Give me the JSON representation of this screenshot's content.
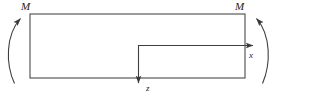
{
  "figure": {
    "title_visible": false,
    "background_color": "#ffffff",
    "line_color": "#444444",
    "text_color": "#1c1c1c",
    "width": 316,
    "height": 100
  },
  "labels": {
    "moment_left": "M",
    "moment_right": "M",
    "axis_x": "x",
    "axis_z": "z"
  },
  "geometry": {
    "beam_rect": {
      "x": 30,
      "y": 14,
      "width": 215,
      "height": 64
    },
    "axis_origin": {
      "x": 138,
      "y": 45
    },
    "x_axis_end": {
      "x": 255,
      "y": 45
    },
    "z_axis_end": {
      "x": 138,
      "y": 86
    },
    "moment_arc_left": {
      "start_x": 14,
      "start_y": 83,
      "end_x": 21,
      "end_y": 16,
      "direction": "counterclockwise-up"
    },
    "moment_arc_right": {
      "start_x": 262,
      "start_y": 83,
      "end_x": 256,
      "end_y": 16,
      "direction": "clockwise-up"
    }
  }
}
